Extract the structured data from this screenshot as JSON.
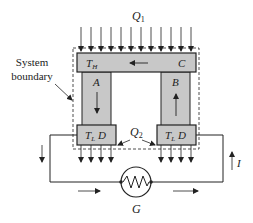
{
  "diagram": {
    "heat_in_label": "Q",
    "heat_in_sub": "1",
    "heat_out_label": "Q",
    "heat_out_sub": "2",
    "boundary_label_line1": "System",
    "boundary_label_line2": "boundary",
    "hot_junction": {
      "temp_label": "T",
      "temp_sub": "H",
      "material_label": "C"
    },
    "left_leg_label": "A",
    "right_leg_label": "B",
    "cold_junction_left": {
      "temp_label": "T",
      "temp_sub": "L",
      "material_label": "D"
    },
    "cold_junction_right": {
      "temp_label": "T",
      "temp_sub": "L",
      "material_label": "D"
    },
    "current_label": "I",
    "generator_label": "G"
  },
  "colors": {
    "block_fill": "#c8c8c8",
    "stroke": "#222222",
    "background": "#ffffff"
  }
}
